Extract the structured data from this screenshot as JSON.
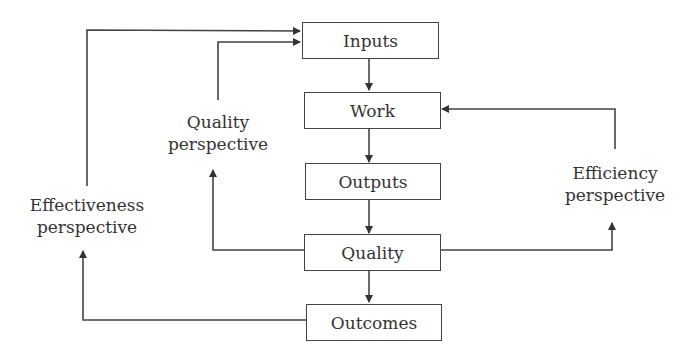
{
  "diagram": {
    "boxes": {
      "inputs": "Inputs",
      "work": "Work",
      "outputs": "Outputs",
      "quality": "Quality",
      "outcomes": "Outcomes"
    },
    "perspectives": {
      "quality": {
        "line1": "Quality",
        "line2": "perspective"
      },
      "effectiveness": {
        "line1": "Effectiveness",
        "line2": "perspective"
      },
      "efficiency": {
        "line1": "Efficiency",
        "line2": "perspective"
      }
    },
    "colors": {
      "line": "#444444",
      "text": "#333333"
    }
  }
}
